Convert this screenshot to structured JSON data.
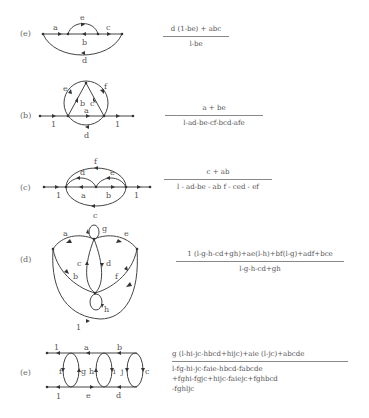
{
  "figures": [
    {
      "id": "e1",
      "label": "(e)",
      "edges": [
        "a",
        "b",
        "c",
        "d",
        "e"
      ],
      "transfer_function": {
        "numerator": "d (1-be) + abc",
        "denominator": "l-be"
      }
    },
    {
      "id": "b",
      "label": "(b)",
      "edges": [
        "1",
        "a",
        "b",
        "c",
        "d",
        "e",
        "f",
        "1"
      ],
      "transfer_function": {
        "numerator": "a + be",
        "denominator": "l-ad-be-cf-bcd-afe"
      }
    },
    {
      "id": "c",
      "label": "(c)",
      "edges": [
        "1",
        "a",
        "b",
        "c",
        "d",
        "e",
        "f",
        "1"
      ],
      "transfer_function": {
        "numerator": "c + ab",
        "denominator": "l - ad-be - ab f - ced - ef"
      }
    },
    {
      "id": "d",
      "label": "(d)",
      "edges": [
        "a",
        "b",
        "c",
        "d",
        "e",
        "f",
        "g",
        "h",
        "1"
      ],
      "transfer_function": {
        "numerator": "1 (l-g-h-cd+gh)+ae(l-h)+bf(l-g)+adf+bce",
        "denominator": "l-g-h-cd+gh"
      }
    },
    {
      "id": "e2",
      "label": "(e)",
      "edges": [
        "1",
        "a",
        "b",
        "c",
        "d",
        "e",
        "f",
        "g",
        "h",
        "i",
        "j",
        "1"
      ],
      "transfer_function": {
        "numerator": "g (l-hi-jc-hbcd+hijc)+aie (l-jc)+abcde",
        "denominator_lines": [
          "l-fg-hi-jc-faie-hbcd-fabcde",
          "+fghi-fgjc+hijc-faiejc+fghbcd",
          "-fghljc"
        ]
      }
    }
  ]
}
